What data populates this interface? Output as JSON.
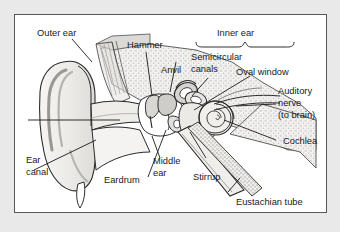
{
  "figure": {
    "background_color": "#e9e9e9",
    "panel_color": "#ffffff",
    "frame_color": "#55585a",
    "ink_color": "#1a1a1a",
    "style": "grayscale cross-section line drawing with stippled bone texture"
  },
  "labels": {
    "outer_ear": "Outer ear",
    "hammer": "Hammer",
    "anvil": "Anvil",
    "inner_ear": "Inner ear",
    "semicircular_1": "Semicircular",
    "semicircular_2": "canals",
    "oval_window": "Oval window",
    "auditory_1": "Auditory",
    "auditory_2": "nerve",
    "auditory_3": "(to brain)",
    "cochlea": "Cochlea",
    "ear_canal_1": "Ear",
    "ear_canal_2": "canal",
    "eardrum": "Eardrum",
    "middle_ear_1": "Middle",
    "middle_ear_2": "ear",
    "stirrup": "Stirrup",
    "eustachian_tube": "Eustachian tube"
  },
  "structures": [
    "pinna",
    "ear-canal",
    "eardrum",
    "hammer-malleus",
    "anvil-incus",
    "stirrup-stapes",
    "oval-window",
    "semicircular-canals",
    "cochlea-spiral",
    "auditory-nerve",
    "eustachian-tube",
    "temporal-bone"
  ],
  "colors": {
    "tissue_fill": "#f2f1ef",
    "tissue_shade": "#dddbd8",
    "bone_stipple": "#c9c7c4",
    "canal_fill": "#ebe9e6",
    "outline": "#2b2b2b"
  }
}
